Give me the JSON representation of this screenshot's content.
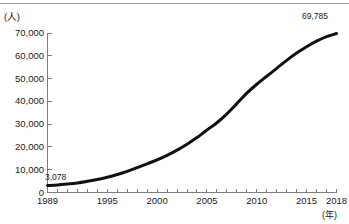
{
  "figure": {
    "unit_y": "(人)",
    "unit_x": "(年)",
    "top_rule": true
  },
  "chart_data": {
    "type": "line",
    "title": "",
    "subtitle": "",
    "xlabel": "(年)",
    "ylabel": "(人)",
    "xlim": [
      1989,
      2018
    ],
    "ylim": [
      0,
      70000
    ],
    "grid": false,
    "legend": "none",
    "y_ticks": [
      0,
      10000,
      20000,
      30000,
      40000,
      50000,
      60000,
      70000
    ],
    "y_tick_labels": [
      "0",
      "10,000",
      "20,000",
      "30,000",
      "40,000",
      "50,000",
      "60,000",
      "70,000"
    ],
    "x_ticks": [
      1989,
      1990,
      1991,
      1992,
      1993,
      1994,
      1995,
      1996,
      1997,
      1998,
      1999,
      2000,
      2001,
      2002,
      2003,
      2004,
      2005,
      2006,
      2007,
      2008,
      2009,
      2010,
      2011,
      2012,
      2013,
      2014,
      2015,
      2016,
      2017,
      2018
    ],
    "x_tick_labels": [
      "1989",
      "1995",
      "2000",
      "2005",
      "2010",
      "2015",
      "2018"
    ],
    "x_labelled_ticks": [
      1989,
      1995,
      2000,
      2005,
      2010,
      2015,
      2018
    ],
    "line_color": "#111111",
    "line_width": 3,
    "annotations": [
      {
        "name": "start-value",
        "x": 1989,
        "y": 3078,
        "text": "3,078"
      },
      {
        "name": "end-value",
        "x": 2018,
        "y": 69785,
        "text": "69,785"
      }
    ],
    "x": [
      1989,
      1990,
      1991,
      1992,
      1993,
      1994,
      1995,
      1996,
      1997,
      1998,
      1999,
      2000,
      2001,
      2002,
      2003,
      2004,
      2005,
      2006,
      2007,
      2008,
      2009,
      2010,
      2011,
      2012,
      2013,
      2014,
      2015,
      2016,
      2017,
      2018
    ],
    "values": [
      3078,
      3300,
      3700,
      4200,
      4900,
      5700,
      6700,
      7900,
      9300,
      10900,
      12600,
      14300,
      16300,
      18600,
      21200,
      24100,
      27400,
      30600,
      34500,
      39000,
      43600,
      47500,
      51000,
      54500,
      58000,
      61200,
      64000,
      66400,
      68400,
      69785
    ]
  }
}
